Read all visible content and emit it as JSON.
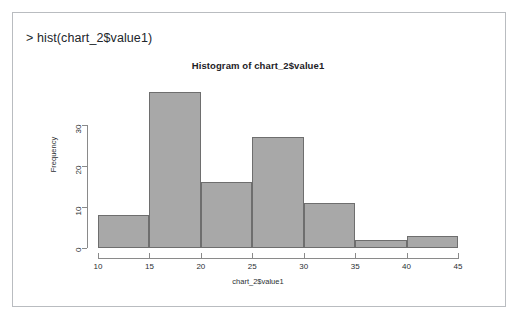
{
  "console": {
    "prompt_line": "> hist(chart_2$value1)"
  },
  "plot": {
    "title": "Histogram of chart_2$value1",
    "xlabel": "chart_2$value1",
    "ylabel": "Frequency",
    "bar_fill_color": "#a8a8a8",
    "bar_border_color": "#6e6e6e",
    "axis_color": "#8a8a8a",
    "frame_border_color": "#b9bcc0"
  },
  "chart_data": {
    "type": "bar",
    "title": "Histogram of chart_2$value1",
    "xlabel": "chart_2$value1",
    "ylabel": "Frequency",
    "bin_edges": [
      10,
      15,
      20,
      25,
      30,
      35,
      40,
      45
    ],
    "categories": [
      "10-15",
      "15-20",
      "20-25",
      "25-30",
      "30-35",
      "35-40",
      "40-45"
    ],
    "values": [
      8,
      38,
      16,
      27,
      11,
      2,
      3
    ],
    "xlim": [
      10,
      45
    ],
    "ylim": [
      0,
      38
    ],
    "xticks": [
      10,
      15,
      20,
      25,
      30,
      35,
      40,
      45
    ],
    "yticks": [
      0,
      10,
      20,
      30
    ],
    "grid": false,
    "legend": null
  }
}
